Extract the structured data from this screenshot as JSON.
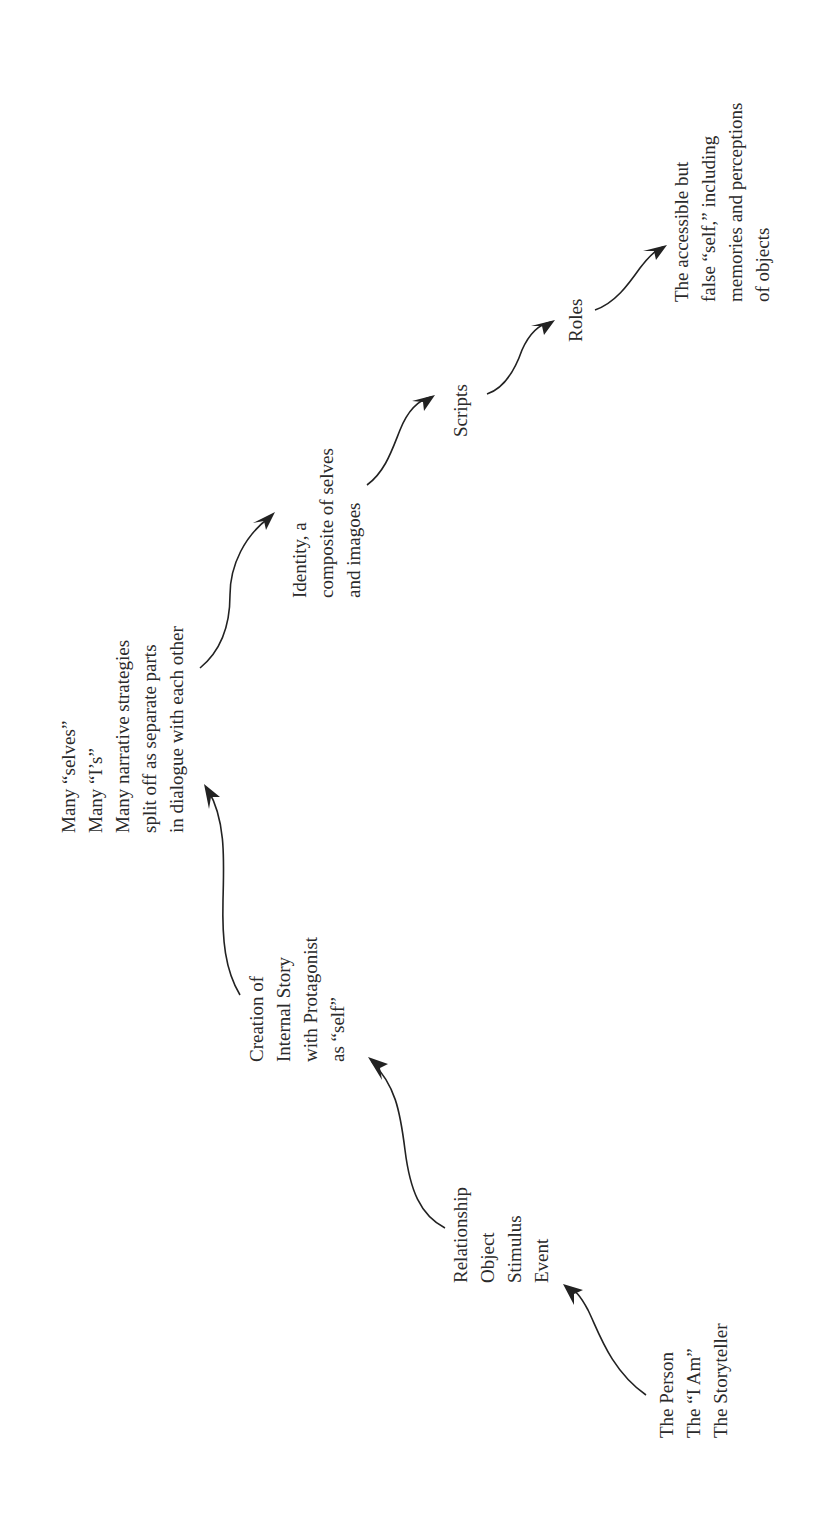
{
  "diagram": {
    "orientation": "rotated -90deg (text reads bottom-to-top)",
    "nodes": [
      {
        "id": "person",
        "lines": [
          "The Person",
          "The “I Am”",
          "The Storyteller"
        ]
      },
      {
        "id": "relationship",
        "lines": [
          "Relationship",
          "Object",
          "Stimulus",
          "Event"
        ]
      },
      {
        "id": "creation",
        "lines": [
          "Creation of",
          "Internal Story",
          "with Protagonist",
          "as “self”"
        ]
      },
      {
        "id": "many",
        "lines": [
          "Many “selves”",
          "Many “I’s”",
          "Many narrative strategies",
          "split off as separate parts",
          "in dialogue with each other"
        ]
      },
      {
        "id": "identity",
        "lines": [
          "Identity, a",
          "composite of selves",
          "and imagoes"
        ]
      },
      {
        "id": "scripts",
        "lines": [
          "Scripts"
        ]
      },
      {
        "id": "roles",
        "lines": [
          "Roles"
        ]
      },
      {
        "id": "accessible",
        "lines": [
          "The accessible but",
          "false “self,” including",
          "memories and perceptions",
          "of objects"
        ]
      }
    ],
    "edges": [
      {
        "from": "person",
        "to": "relationship"
      },
      {
        "from": "relationship",
        "to": "creation"
      },
      {
        "from": "creation",
        "to": "many"
      },
      {
        "from": "many",
        "to": "identity"
      },
      {
        "from": "identity",
        "to": "scripts"
      },
      {
        "from": "scripts",
        "to": "roles"
      },
      {
        "from": "roles",
        "to": "accessible"
      }
    ]
  }
}
